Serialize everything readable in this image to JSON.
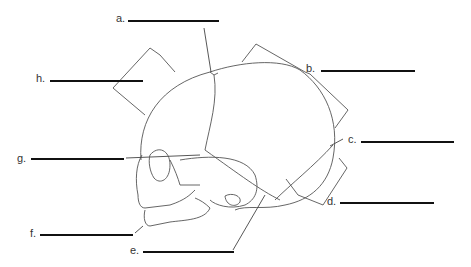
{
  "diagram": {
    "labels": [
      {
        "id": "a",
        "text": "a.",
        "answer": ""
      },
      {
        "id": "b",
        "text": "b.",
        "answer": ""
      },
      {
        "id": "c",
        "text": "c.",
        "answer": ""
      },
      {
        "id": "d",
        "text": "d.",
        "answer": ""
      },
      {
        "id": "e",
        "text": "e.",
        "answer": ""
      },
      {
        "id": "f",
        "text": "f.",
        "answer": ""
      },
      {
        "id": "g",
        "text": "g.",
        "answer": ""
      },
      {
        "id": "h",
        "text": "h.",
        "answer": ""
      }
    ],
    "colors": {
      "line": "#555555",
      "blank": "#111111",
      "background": "#ffffff"
    }
  }
}
